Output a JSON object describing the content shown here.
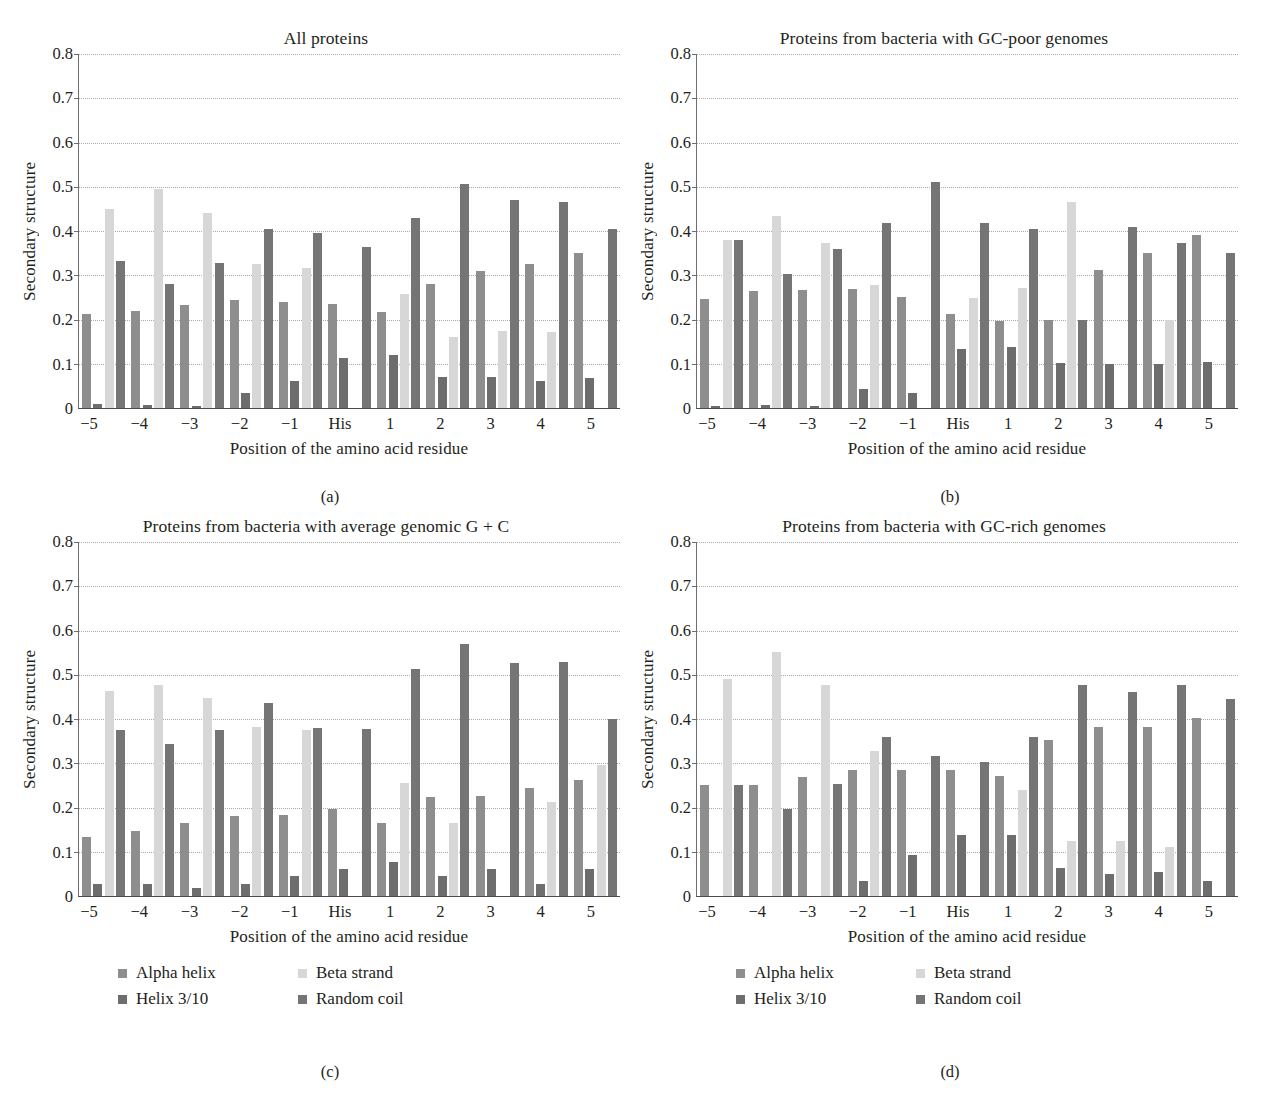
{
  "figure": {
    "ylabel": "Secondary structure",
    "xlabel": "Position of the amino acid residue",
    "categories": [
      "−5",
      "−4",
      "−3",
      "−2",
      "−1",
      "His",
      "1",
      "2",
      "3",
      "4",
      "5"
    ],
    "yticks": [
      "0.8",
      "0.7",
      "0.6",
      "0.5",
      "0.4",
      "0.3",
      "0.2",
      "0.1",
      "0"
    ],
    "ylim": [
      0,
      0.8
    ],
    "series_names": [
      "Alpha helix",
      "Helix 3/10",
      "Beta strand",
      "Random coil"
    ],
    "colors": {
      "alpha_helix": "#8e8e8e",
      "helix_3_10": "#6d6d6d",
      "beta_strand": "#d7d7d7",
      "random_coil": "#757575"
    },
    "legend": {
      "alpha_helix": "Alpha helix",
      "beta_strand": "Beta strand",
      "helix_3_10": "Helix 3/10",
      "random_coil": "Random coil"
    },
    "captions": {
      "a": "(a)",
      "b": "(b)",
      "c": "(c)",
      "d": "(d)"
    }
  },
  "chart_data": [
    {
      "panel": "a",
      "type": "bar",
      "title": "All proteins",
      "xlabel": "Position of the amino acid residue",
      "ylabel": "Secondary structure",
      "ylim": [
        0,
        0.8
      ],
      "grid": true,
      "legend_position": "below-figure",
      "categories": [
        "−5",
        "−4",
        "−3",
        "−2",
        "−1",
        "His",
        "1",
        "2",
        "3",
        "4",
        "5"
      ],
      "series": [
        {
          "name": "Alpha helix",
          "values": [
            0.212,
            0.22,
            0.232,
            0.244,
            0.24,
            0.236,
            0.216,
            0.281,
            0.31,
            0.325,
            0.35
          ]
        },
        {
          "name": "Helix 3/10",
          "values": [
            0.008,
            0.007,
            0.005,
            0.035,
            0.062,
            0.113,
            0.12,
            0.07,
            0.071,
            0.06,
            0.067
          ]
        },
        {
          "name": "Beta strand",
          "values": [
            0.449,
            0.494,
            0.44,
            0.326,
            0.316,
            0.0,
            0.258,
            0.16,
            0.175,
            0.172,
            0.0
          ]
        },
        {
          "name": "Random coil",
          "values": [
            0.333,
            0.28,
            0.328,
            0.405,
            0.395,
            0.364,
            0.43,
            0.507,
            0.47,
            0.466,
            0.405
          ]
        }
      ]
    },
    {
      "panel": "b",
      "type": "bar",
      "title": "Proteins from bacteria with GC-poor genomes",
      "xlabel": "Position of the amino acid residue",
      "ylabel": "Secondary structure",
      "ylim": [
        0,
        0.8
      ],
      "grid": true,
      "legend_position": "below-figure",
      "categories": [
        "−5",
        "−4",
        "−3",
        "−2",
        "−1",
        "His",
        "1",
        "2",
        "3",
        "4",
        "5"
      ],
      "series": [
        {
          "name": "Alpha helix",
          "values": [
            0.246,
            0.265,
            0.266,
            0.269,
            0.25,
            0.212,
            0.196,
            0.2,
            0.312,
            0.35,
            0.39
          ]
        },
        {
          "name": "Helix 3/10",
          "values": [
            0.005,
            0.006,
            0.004,
            0.042,
            0.035,
            0.134,
            0.138,
            0.101,
            0.1,
            0.1,
            0.103
          ]
        },
        {
          "name": "Beta strand",
          "values": [
            0.38,
            0.434,
            0.372,
            0.277,
            0.0,
            0.248,
            0.272,
            0.465,
            0.0,
            0.2,
            0.0
          ]
        },
        {
          "name": "Random coil",
          "values": [
            0.379,
            0.303,
            0.36,
            0.417,
            0.511,
            0.417,
            0.405,
            0.198,
            0.408,
            0.372,
            0.35
          ]
        }
      ]
    },
    {
      "panel": "c",
      "type": "bar",
      "title": "Proteins from bacteria with average genomic G + C",
      "xlabel": "Position of the amino acid residue",
      "ylabel": "Secondary structure",
      "ylim": [
        0,
        0.8
      ],
      "grid": true,
      "legend_position": "below-panel",
      "categories": [
        "−5",
        "−4",
        "−3",
        "−2",
        "−1",
        "His",
        "1",
        "2",
        "3",
        "4",
        "5"
      ],
      "series": [
        {
          "name": "Alpha helix",
          "values": [
            0.133,
            0.148,
            0.165,
            0.18,
            0.182,
            0.196,
            0.166,
            0.224,
            0.225,
            0.243,
            0.262
          ]
        },
        {
          "name": "Helix 3/10",
          "values": [
            0.028,
            0.028,
            0.017,
            0.028,
            0.045,
            0.06,
            0.076,
            0.046,
            0.06,
            0.028,
            0.06
          ]
        },
        {
          "name": "Beta strand",
          "values": [
            0.464,
            0.477,
            0.447,
            0.383,
            0.375,
            0.0,
            0.255,
            0.166,
            0.0,
            0.212,
            0.295
          ]
        },
        {
          "name": "Random coil",
          "values": [
            0.375,
            0.344,
            0.375,
            0.437,
            0.379,
            0.377,
            0.513,
            0.57,
            0.527,
            0.528,
            0.4
          ]
        }
      ]
    },
    {
      "panel": "d",
      "type": "bar",
      "title": "Proteins from bacteria with GC-rich genomes",
      "xlabel": "Position of the amino acid residue",
      "ylabel": "Secondary structure",
      "ylim": [
        0,
        0.8
      ],
      "grid": true,
      "legend_position": "below-panel",
      "categories": [
        "−5",
        "−4",
        "−3",
        "−2",
        "−1",
        "His",
        "1",
        "2",
        "3",
        "4",
        "5"
      ],
      "series": [
        {
          "name": "Alpha helix",
          "values": [
            0.252,
            0.252,
            0.27,
            0.285,
            0.285,
            0.285,
            0.272,
            0.352,
            0.383,
            0.383,
            0.402
          ]
        },
        {
          "name": "Helix 3/10",
          "values": [
            0.0,
            0.0,
            0.0,
            0.033,
            0.092,
            0.139,
            0.138,
            0.063,
            0.05,
            0.055,
            0.035
          ]
        },
        {
          "name": "Beta strand",
          "values": [
            0.49,
            0.551,
            0.476,
            0.327,
            0.0,
            0.0,
            0.24,
            0.124,
            0.125,
            0.11,
            0.0
          ]
        },
        {
          "name": "Random coil",
          "values": [
            0.252,
            0.196,
            0.253,
            0.36,
            0.316,
            0.303,
            0.36,
            0.477,
            0.46,
            0.477,
            0.445
          ]
        }
      ]
    }
  ]
}
